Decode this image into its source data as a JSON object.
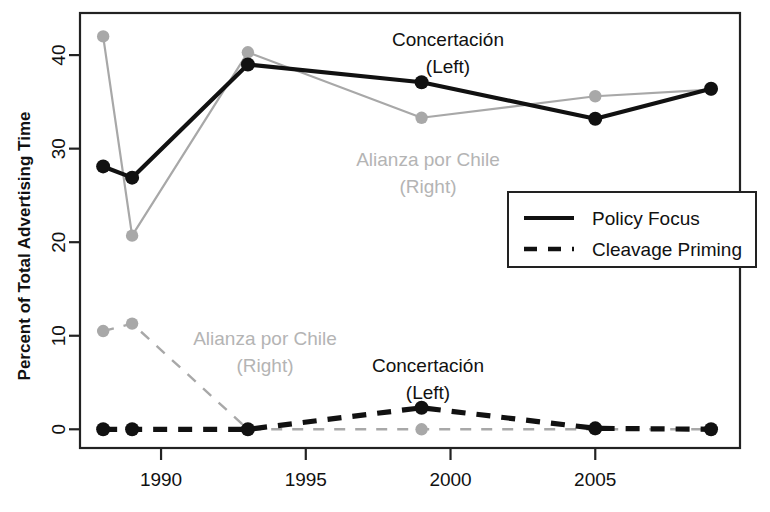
{
  "chart_data": {
    "type": "line",
    "title": "",
    "xlabel": "",
    "ylabel": "Percent of Total Advertising Time",
    "xlim": [
      1987.2,
      2010.0
    ],
    "ylim": [
      -2.0,
      44.5
    ],
    "xticks": [
      1990,
      1995,
      2000,
      2005
    ],
    "xtick_labels": [
      "1990",
      "1995",
      "2000",
      "2005"
    ],
    "yticks": [
      0,
      10,
      20,
      30,
      40
    ],
    "ytick_labels": [
      "0",
      "10",
      "20",
      "30",
      "40"
    ],
    "grid": false,
    "legend_position": "center-right",
    "x": [
      1988,
      1989,
      1993,
      1999,
      2005,
      2009
    ],
    "series": [
      {
        "name": "Concertación (Left) — Policy Focus",
        "party": "Concertación (Left)",
        "measure": "Policy Focus",
        "color": "#111111",
        "line_style": "solid",
        "values": [
          28.1,
          26.9,
          39.0,
          37.1,
          33.2,
          36.4
        ]
      },
      {
        "name": "Alianza por Chile (Right) — Policy Focus",
        "party": "Alianza por Chile (Right)",
        "measure": "Policy Focus",
        "color": "#a8a8a8",
        "line_style": "solid",
        "values": [
          42.0,
          20.7,
          40.3,
          33.3,
          35.6,
          36.3
        ]
      },
      {
        "name": "Concertación (Left) — Cleavage Priming",
        "party": "Concertación (Left)",
        "measure": "Cleavage Priming",
        "color": "#111111",
        "line_style": "dashed",
        "values": [
          0.0,
          0.0,
          0.0,
          2.3,
          0.1,
          0.0
        ]
      },
      {
        "name": "Alianza por Chile (Right) — Cleavage Priming",
        "party": "Alianza por Chile (Right)",
        "measure": "Cleavage Priming",
        "color": "#a8a8a8",
        "line_style": "dashed",
        "values": [
          10.5,
          11.3,
          0.0,
          0.0,
          0.0,
          0.0
        ]
      }
    ],
    "annotations": [
      {
        "id": "concertacion-top",
        "line1": "Concertación",
        "line2": "(Left)",
        "color": "#111111",
        "x": 448,
        "y": 46
      },
      {
        "id": "alianza-top",
        "line1": "Alianza por Chile",
        "line2": "(Right)",
        "color": "#b4b4b4",
        "x": 428,
        "y": 166
      },
      {
        "id": "alianza-bottom",
        "line1": "Alianza por Chile",
        "line2": "(Right)",
        "color": "#b4b4b4",
        "x": 265,
        "y": 345
      },
      {
        "id": "concertacion-bottom",
        "line1": "Concertación",
        "line2": "(Left)",
        "color": "#111111",
        "x": 428,
        "y": 372
      }
    ],
    "legend": {
      "entries": [
        {
          "label": "Policy Focus",
          "line_style": "solid",
          "color": "#111111"
        },
        {
          "label": "Cleavage Priming",
          "line_style": "dashed",
          "color": "#111111"
        }
      ]
    }
  }
}
